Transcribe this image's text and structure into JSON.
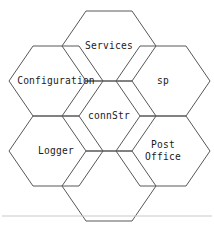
{
  "diagram": {
    "stroke_color": "#58585a",
    "text_color": "#1a1a1a",
    "background_color": "#ffffff",
    "separator_color": "#c9c9cb",
    "cells": [
      {
        "id": "services",
        "label": "Services",
        "cx": 109,
        "cy": 46,
        "empty": false
      },
      {
        "id": "configuration",
        "label": "Configuration",
        "cx": 56,
        "cy": 81,
        "empty": false
      },
      {
        "id": "sp",
        "label": "sp",
        "cx": 163,
        "cy": 81,
        "empty": false
      },
      {
        "id": "connstr",
        "label": "connStr",
        "cx": 109,
        "cy": 116,
        "empty": false
      },
      {
        "id": "logger",
        "label": "Logger",
        "cx": 56,
        "cy": 151,
        "empty": false
      },
      {
        "id": "post-office",
        "label": "Post\nOffice",
        "cx": 163,
        "cy": 151,
        "empty": false
      },
      {
        "id": "blank-bottom",
        "label": "",
        "cx": 109,
        "cy": 186,
        "empty": true
      }
    ],
    "separator": {
      "y": 216,
      "x1": 2,
      "x2": 212
    }
  }
}
